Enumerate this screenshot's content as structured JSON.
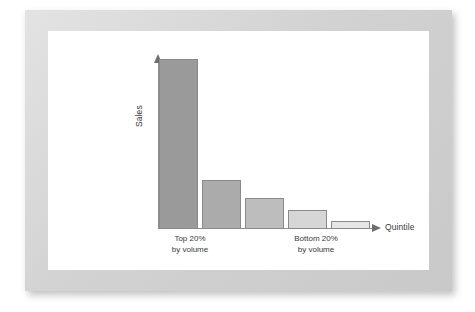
{
  "figure": {
    "frame_color": "#d6d6d6",
    "canvas_color": "#ffffff",
    "axis_color": "#8f8f8f"
  },
  "chart_data": {
    "type": "bar",
    "title": "",
    "subtitle": "",
    "xlabel": "Quintile",
    "ylabel": "Sales",
    "grid": false,
    "legend": "none",
    "categories": [
      "Quintile 1",
      "Quintile 2",
      "Quintile 3",
      "Quintile 4",
      "Quintile 5"
    ],
    "values": [
      100,
      29,
      18,
      11,
      5
    ],
    "ylim": [
      0,
      100
    ],
    "bar_colors": [
      "#9a9a9a",
      "#ababab",
      "#bdbdbd",
      "#d6d6d6",
      "#e6e6e6"
    ],
    "bar_border_color": "#8a8a8a",
    "annotations": [
      {
        "text_line1": "Top 20%",
        "text_line2": "by volume",
        "anchor": "Quintile 1"
      },
      {
        "text_line1": "Bottom 20%",
        "text_line2": "by volume",
        "anchor": "Quintile 5"
      }
    ],
    "bars": [
      {
        "name": "bar-quintile-1",
        "value": 100,
        "color": "#9a9a9a"
      },
      {
        "name": "bar-quintile-2",
        "value": 29,
        "color": "#ababab"
      },
      {
        "name": "bar-quintile-3",
        "value": 18,
        "color": "#bdbdbd"
      },
      {
        "name": "bar-quintile-4",
        "value": 11,
        "color": "#d6d6d6"
      },
      {
        "name": "bar-quintile-5",
        "value": 5,
        "color": "#e6e6e6"
      }
    ]
  },
  "captions": {
    "left_line1": "Top 20%",
    "left_line2": "by volume",
    "right_line1": "Bottom 20%",
    "right_line2": "by volume"
  }
}
